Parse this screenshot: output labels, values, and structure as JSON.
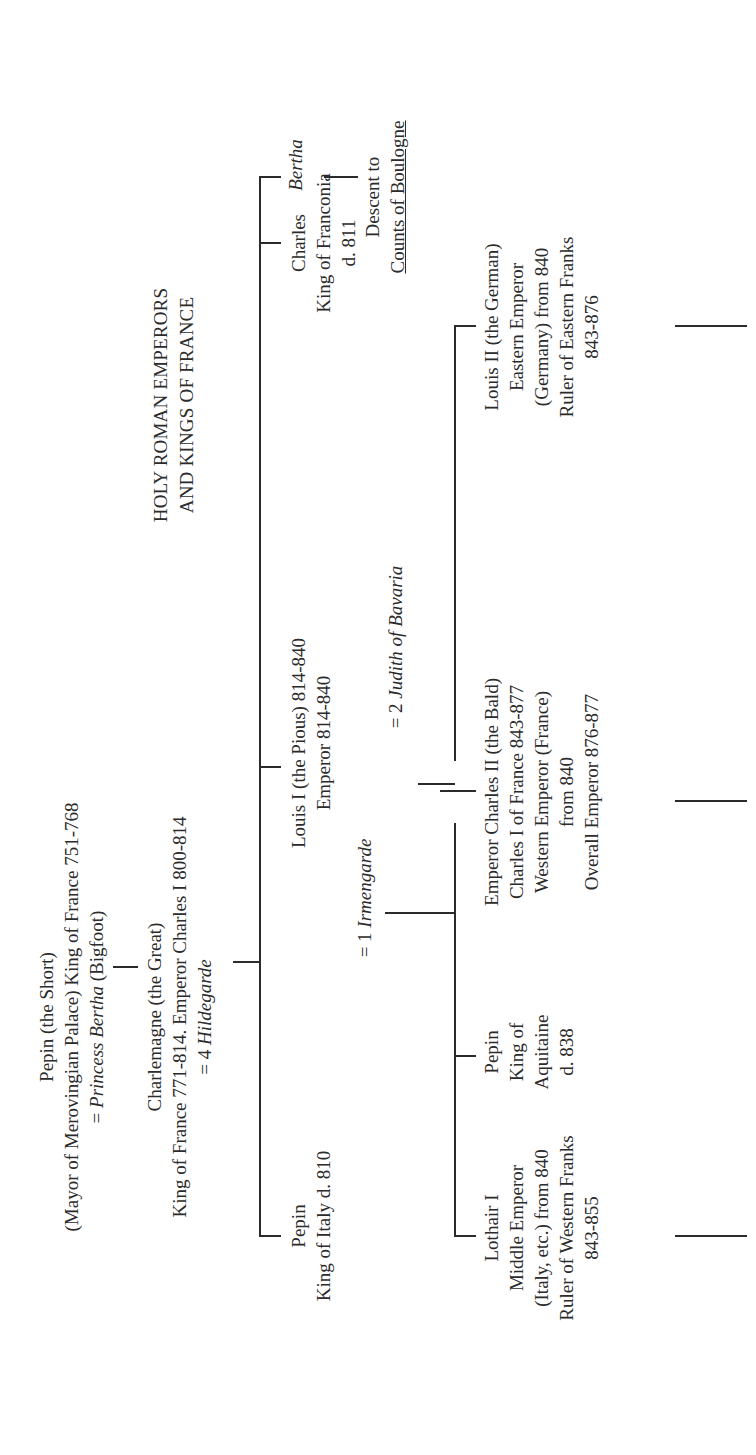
{
  "title": {
    "line1": "HOLY ROMAN EMPERORS",
    "line2": "AND KINGS OF FRANCE"
  },
  "generation1": {
    "pepin_short": {
      "name": "Pepin (the Short)",
      "line2": "(Mayor of Merovingian Palace) King of France 751-768",
      "spouse_prefix": "= ",
      "spouse_name": "Princess Bertha",
      "spouse_suffix": " (Bigfoot)"
    }
  },
  "generation2": {
    "charlemagne": {
      "name": "Charlemagne (the Great)",
      "line2": "King of France 771-814. Emperor Charles I 800-814",
      "spouse_prefix": "= 4 ",
      "spouse_name": "Hildegarde"
    }
  },
  "generation3": {
    "pepin_italy": {
      "name": "Pepin",
      "line2": "King of Italy d. 810"
    },
    "louis_pious": {
      "name": "Louis I (the Pious) 814-840",
      "line2": "Emperor 814-840",
      "spouse1_prefix": "= 1 ",
      "spouse1_name": "Irmengarde",
      "spouse2_prefix": "= 2 ",
      "spouse2_name": "Judith of Bavaria"
    },
    "charles_franconia": {
      "name": "Charles",
      "line2": "King of Franconia",
      "line3": "d. 811"
    },
    "bertha": {
      "name": "Bertha",
      "descent_line1": "Descent to",
      "descent_line2": "Counts of Boulogne"
    }
  },
  "generation4": {
    "lothair": {
      "name": "Lothair I",
      "line2": "Middle Emperor",
      "line3": "(Italy, etc.) from 840",
      "line4": "Ruler of Western Franks",
      "line5": "843-855"
    },
    "pepin_aquitaine": {
      "name": "Pepin",
      "line2": "King of",
      "line3": "Aquitaine",
      "line4": "d. 838"
    },
    "charles_bald": {
      "name": "Emperor Charles II (the Bald)",
      "line2": "Charles I of France 843-877",
      "line3": "Western Emperor (France)",
      "line4": "from 840",
      "line5": "Overall Emperor 876-877"
    },
    "louis_german": {
      "name": "Louis II (the German)",
      "line2": "Eastern Emperor",
      "line3": "(Germany) from 840",
      "line4": "Ruler of Eastern Franks",
      "line5": "843-876"
    }
  },
  "colors": {
    "ink": "#2b2b2b",
    "background": "#ffffff"
  }
}
